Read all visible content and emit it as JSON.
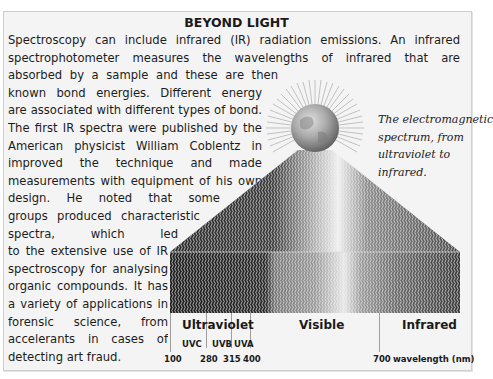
{
  "title": "BEYOND LIGHT",
  "body_lines": [
    {
      "text": "Spectroscopy can include infrared (IR) radiation emissions. An infrared",
      "width": 452
    },
    {
      "text": "spectrophotometer measures the wavelengths of infrared that are",
      "width": 452
    },
    {
      "text": "absorbed by a sample and these are then related to",
      "width": 270
    },
    {
      "text": "known bond energies. Different energy patterns",
      "width": 254
    },
    {
      "text": "are associated with different types of bond.",
      "width": 254
    },
    {
      "text": "The first IR spectra were published by the",
      "width": 254
    },
    {
      "text": "American physicist William Coblentz in 1905. He",
      "width": 254
    },
    {
      "text": "improved the technique and made painstaking",
      "width": 254
    },
    {
      "text": "measurements with equipment of his own",
      "width": 254
    },
    {
      "text": "design. He noted that some molecular",
      "width": 212
    },
    {
      "text": "groups produced characteristic",
      "width": 192
    },
    {
      "text": "spectra, which led eventually",
      "width": 170
    },
    {
      "text": "to the extensive use of IR",
      "width": 160
    },
    {
      "text": "spectroscopy for analysing",
      "width": 160
    },
    {
      "text": "organic compounds. It has",
      "width": 160
    },
    {
      "text": "a variety of applications in",
      "width": 160
    },
    {
      "text": "forensic science, from finding",
      "width": 160
    },
    {
      "text": "accelerants in cases of arson to",
      "width": 160
    },
    {
      "text": "detecting art fraud.",
      "width": 0
    }
  ],
  "caption_lines": [
    "The electromagnetic",
    "spectrum, from",
    "ultraviolet to",
    "infrared."
  ],
  "figure": {
    "icon": "globe-light-source-icon",
    "bands": {
      "ultraviolet": "Ultraviolet",
      "visible": "Visible",
      "infrared": "Infrared"
    },
    "sub_bands": [
      "UVC",
      "UVB",
      "UVA"
    ],
    "ticks": [
      "100",
      "280",
      "315",
      "400",
      "700"
    ],
    "axis_label": "wavelength (nm)"
  },
  "colors": {
    "panel_bg": "#f4f4f4",
    "panel_border": "#cfcfcf",
    "text": "#1c1c1c"
  }
}
